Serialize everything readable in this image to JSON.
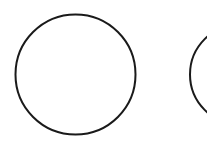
{
  "diagram": {
    "background": "#ffffff",
    "stroke_color": "#1a1a1a",
    "stroke_width": 2,
    "shapes": [
      {
        "type": "circle",
        "name": "left-circle",
        "cx": 75.5,
        "cy": 74.5,
        "r": 60,
        "fill": "none"
      },
      {
        "type": "circle",
        "name": "right-circle-partial",
        "cx": 240,
        "cy": 74.5,
        "r": 50,
        "fill": "none"
      }
    ]
  }
}
